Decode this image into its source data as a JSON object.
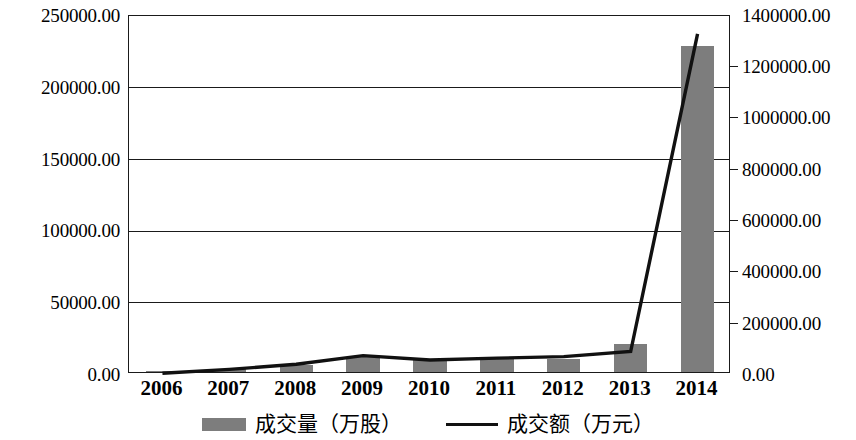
{
  "chart_data": {
    "type": "bar",
    "title": "",
    "subtitle": "",
    "xlabel": "",
    "ylabel": "",
    "y2label": "",
    "grid": true,
    "legend_position": "bottom",
    "categories": [
      "2006",
      "2007",
      "2008",
      "2009",
      "2010",
      "2011",
      "2012",
      "2013",
      "2014"
    ],
    "axes": {
      "left": {
        "label": "",
        "ylim": [
          0,
          250000
        ],
        "ticks": [
          0,
          50000,
          100000,
          150000,
          200000,
          250000
        ],
        "tick_labels": [
          "0.00",
          "50000.00",
          "100000.00",
          "150000.00",
          "200000.00",
          "250000.00"
        ]
      },
      "right": {
        "label": "",
        "ylim": [
          0,
          1400000
        ],
        "ticks": [
          0,
          200000,
          400000,
          600000,
          800000,
          1000000,
          1200000,
          1400000
        ],
        "tick_labels": [
          "0.00",
          "200000.00",
          "400000.00",
          "600000.00",
          "800000.00",
          "1000000.00",
          "1200000.00",
          "1400000.00"
        ]
      }
    },
    "series": [
      {
        "name": "成交量（万股）",
        "type": "bar",
        "axis": "left",
        "color": "#7d7d7d",
        "values": [
          600,
          2100,
          4800,
          10500,
          8200,
          9000,
          9300,
          19500,
          227500
        ]
      },
      {
        "name": "成交额（万元）",
        "type": "line",
        "axis": "right",
        "color": "#111111",
        "values": [
          3000,
          18000,
          38000,
          72000,
          55000,
          62000,
          68000,
          88000,
          1330000
        ]
      }
    ]
  },
  "legend": {
    "items": [
      {
        "label": "成交量（万股）",
        "marker": "bar-swatch",
        "color": "#7d7d7d"
      },
      {
        "label": "成交额（万元）",
        "marker": "line-swatch",
        "color": "#111111"
      }
    ]
  },
  "axis_left_labels": [
    "250000.00",
    "200000.00",
    "150000.00",
    "100000.00",
    "50000.00",
    "0.00"
  ],
  "axis_right_labels": [
    "1400000.00",
    "1200000.00",
    "1000000.00",
    "800000.00",
    "600000.00",
    "400000.00",
    "200000.00",
    "0.00"
  ],
  "x_axis_labels": [
    "2006",
    "2007",
    "2008",
    "2009",
    "2010",
    "2011",
    "2012",
    "2013",
    "2014"
  ]
}
